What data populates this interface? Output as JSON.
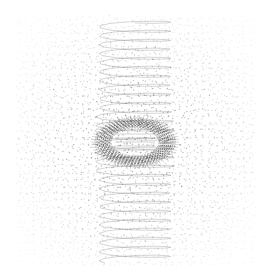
{
  "image": {
    "width": 267,
    "height": 274,
    "background": "#ffffff",
    "ink": "#333333",
    "description": "Abstract grayscale generative pattern: dot-grid moiré field with a vertical helical coil and a dense elliptical ring at center"
  },
  "pattern": {
    "field": {
      "x0": 18,
      "y0": 18,
      "x1": 250,
      "y1": 262,
      "cols": 34,
      "rows": 36,
      "dot_radius": 0.7,
      "jitter": 2.2,
      "max_opacity": 0.55
    },
    "coil": {
      "cx": 135,
      "y_top": 20,
      "y_bottom": 262,
      "half_width": 36,
      "loop_height": 9,
      "stroke": "#555555",
      "stroke_opacity": 0.35
    },
    "eye": {
      "cx": 135,
      "cy": 142,
      "outer_rx": 40,
      "outer_ry": 24,
      "inner_rx": 24,
      "inner_ry": 14,
      "rings": 9,
      "stroke": "#222222"
    }
  }
}
